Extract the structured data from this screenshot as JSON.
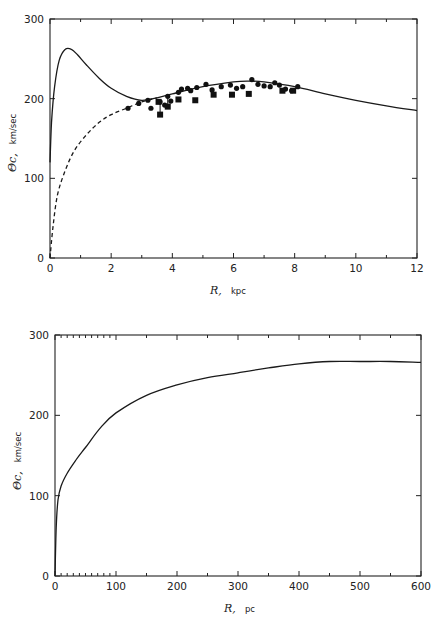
{
  "chart_data": [
    {
      "type": "line",
      "title": "",
      "xlabel": "R, kpc",
      "xlabel_symbol": "R,",
      "xlabel_unit": "kpc",
      "ylabel": "Θc, km/sec",
      "ylabel_symbol": "Θc,",
      "ylabel_unit": "km/sec",
      "xlim": [
        0,
        12
      ],
      "ylim": [
        0,
        300
      ],
      "xticks": [
        "0",
        "2",
        "4",
        "6",
        "8",
        "10",
        "12"
      ],
      "yticks": [
        "0",
        "100",
        "200",
        "300"
      ],
      "grid": false,
      "legend": null,
      "series": [
        {
          "name": "model rotation curve (solid)",
          "style": "solid",
          "x": [
            0.0,
            0.05,
            0.15,
            0.3,
            0.5,
            0.7,
            0.9,
            1.2,
            1.6,
            2.0,
            2.5,
            3.0,
            3.5,
            4.0,
            5.0,
            6.0,
            6.5,
            7.0,
            8.0,
            9.0,
            10.0,
            11.0,
            12.0
          ],
          "y": [
            120,
            170,
            215,
            248,
            262,
            262,
            255,
            242,
            226,
            213,
            203,
            198,
            201,
            206,
            215,
            221,
            222,
            221,
            215,
            206,
            198,
            191,
            185
          ]
        },
        {
          "name": "model rotation curve (dashed)",
          "style": "dashed",
          "x": [
            0.0,
            0.1,
            0.25,
            0.5,
            0.8,
            1.2,
            1.6,
            2.0,
            2.5,
            3.0,
            3.5
          ],
          "y": [
            0,
            40,
            80,
            110,
            135,
            155,
            170,
            180,
            188,
            196,
            201
          ]
        },
        {
          "name": "observations (circles)",
          "style": "marker-circle",
          "x": [
            2.55,
            2.9,
            3.2,
            3.3,
            3.6,
            3.75,
            3.85,
            3.95,
            4.2,
            4.3,
            4.5,
            4.6,
            4.8,
            5.1,
            5.3,
            5.6,
            5.9,
            6.1,
            6.3,
            6.6,
            6.8,
            7.0,
            7.2,
            7.35,
            7.5,
            7.7,
            7.9,
            8.1
          ],
          "y": [
            188,
            194,
            198,
            188,
            196,
            192,
            203,
            197,
            208,
            212,
            213,
            210,
            214,
            218,
            211,
            215,
            217,
            213,
            215,
            224,
            218,
            216,
            215,
            220,
            217,
            212,
            210,
            215
          ]
        },
        {
          "name": "observations (squares)",
          "style": "marker-square",
          "x": [
            3.55,
            3.6,
            3.85,
            4.2,
            4.75,
            5.35,
            5.95,
            6.5,
            7.6,
            7.95
          ],
          "y": [
            196,
            180,
            190,
            199,
            198,
            205,
            205,
            206,
            210,
            210
          ]
        }
      ]
    },
    {
      "type": "line",
      "title": "",
      "xlabel": "R, pc",
      "xlabel_symbol": "R,",
      "xlabel_unit": "pc",
      "ylabel": "Θc, km/sec",
      "ylabel_symbol": "Θc,",
      "ylabel_unit": "km/sec",
      "xlim": [
        0,
        600
      ],
      "ylim": [
        0,
        300
      ],
      "xticks": [
        "0",
        "100",
        "200",
        "300",
        "400",
        "500",
        "600"
      ],
      "yticks": [
        "0",
        "100",
        "200",
        "300"
      ],
      "grid": false,
      "legend": null,
      "series": [
        {
          "name": "inner rotation curve",
          "style": "solid",
          "x": [
            0,
            2,
            5,
            10,
            20,
            35,
            50,
            75,
            100,
            150,
            200,
            250,
            300,
            350,
            400,
            450,
            500,
            550,
            600
          ],
          "y": [
            0,
            60,
            95,
            112,
            128,
            145,
            160,
            185,
            203,
            225,
            238,
            247,
            253,
            259,
            264,
            267,
            267,
            267,
            266
          ]
        }
      ]
    }
  ]
}
